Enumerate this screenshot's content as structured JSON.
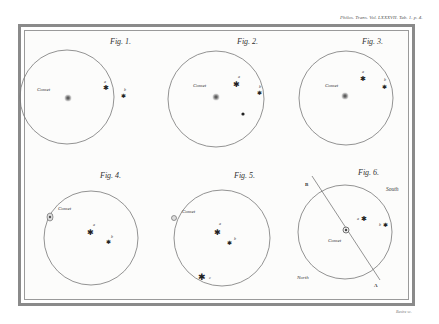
{
  "plate": {
    "reference": "Philos. Trans. Vol. LXXXVII. Tab. 1. p. 4.",
    "engraver": "Basire sc."
  },
  "figures": [
    {
      "label": "Fig. 1.",
      "cx": 67,
      "cy": 97,
      "r": 47,
      "comet": {
        "x": 68,
        "y": 98,
        "label": "Comet",
        "lx": 37,
        "ly": 91
      },
      "stars": [
        {
          "x": 105,
          "y": 87,
          "label": "a"
        },
        {
          "x": 123,
          "y": 95,
          "label": "b"
        }
      ]
    },
    {
      "label": "Fig. 2.",
      "cx": 216,
      "cy": 99,
      "r": 48,
      "comet": {
        "x": 216,
        "y": 97,
        "label": "Comet",
        "lx": 193,
        "ly": 87
      },
      "stars": [
        {
          "x": 236,
          "y": 84,
          "label": "a"
        },
        {
          "x": 259,
          "y": 92,
          "label": "b"
        },
        {
          "x": 243,
          "y": 114,
          "label": ""
        }
      ]
    },
    {
      "label": "Fig. 3.",
      "cx": 346,
      "cy": 98,
      "r": 47,
      "comet": {
        "x": 345,
        "y": 96,
        "label": "Comet",
        "lx": 325,
        "ly": 87
      },
      "stars": [
        {
          "x": 362,
          "y": 78,
          "label": "a"
        },
        {
          "x": 384,
          "y": 86,
          "label": "b"
        }
      ]
    },
    {
      "label": "Fig. 4.",
      "cx": 91,
      "cy": 238,
      "r": 47,
      "comet": {
        "x": 50,
        "y": 217,
        "label": "Comet",
        "lx": 58,
        "ly": 210
      },
      "stars": [
        {
          "x": 90,
          "y": 232,
          "label": "a"
        },
        {
          "x": 108,
          "y": 241,
          "label": "b"
        }
      ]
    },
    {
      "label": "Fig. 5.",
      "cx": 222,
      "cy": 238,
      "r": 48,
      "comet": {
        "x": 174,
        "y": 218,
        "label": "Comet",
        "lx": 182,
        "ly": 213
      },
      "stars": [
        {
          "x": 217,
          "y": 231,
          "label": "a"
        },
        {
          "x": 229,
          "y": 242,
          "label": "b"
        },
        {
          "x": 202,
          "y": 277,
          "label": "c"
        }
      ]
    },
    {
      "label": "Fig. 6.",
      "cx": 345,
      "cy": 232,
      "r": 47,
      "comet": {
        "x": 346,
        "y": 230,
        "label": "Comet",
        "lx": 328,
        "ly": 242
      },
      "stars": [
        {
          "x": 363,
          "y": 218,
          "label": "a"
        },
        {
          "x": 385,
          "y": 225,
          "label": "b"
        }
      ],
      "line": {
        "x1": 312,
        "y1": 176,
        "x2": 380,
        "y2": 280,
        "label_start": "B",
        "label_end": "A"
      },
      "directions": {
        "south": "South",
        "north": "North"
      }
    }
  ]
}
